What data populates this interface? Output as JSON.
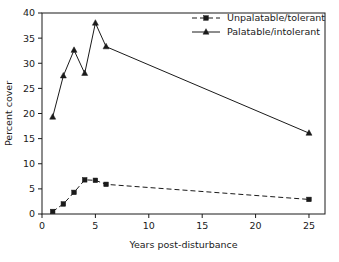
{
  "chart_data": {
    "type": "line",
    "title": "",
    "xlabel": "Years post-disturbance",
    "ylabel": "Percent cover",
    "xlim": [
      0,
      26.5
    ],
    "ylim": [
      0,
      40
    ],
    "xticks": [
      "0",
      "5",
      "10",
      "15",
      "20",
      "25"
    ],
    "xtick_values": [
      0,
      5,
      10,
      15,
      20,
      25
    ],
    "yticks": [
      "0",
      "5",
      "10",
      "15",
      "20",
      "25",
      "30",
      "35",
      "40"
    ],
    "ytick_values": [
      0,
      5,
      10,
      15,
      20,
      25,
      30,
      35,
      40
    ],
    "grid": false,
    "legend_position": "top-right-inside",
    "x": [
      1,
      2,
      3,
      4,
      5,
      6,
      25
    ],
    "series": [
      {
        "name": "Unpalatable/tolerant",
        "marker": "square",
        "linestyle": "dashed",
        "color": "#1a1a1a",
        "values": [
          0.5,
          2.0,
          4.3,
          6.8,
          6.7,
          5.9,
          2.9
        ]
      },
      {
        "name": "Palatable/intolerant",
        "marker": "triangle",
        "linestyle": "solid",
        "color": "#1a1a1a",
        "values": [
          19.3,
          27.5,
          32.6,
          28.0,
          38.0,
          33.3,
          16.1
        ]
      }
    ]
  },
  "legend": {
    "items": [
      {
        "label": "Unpalatable/tolerant"
      },
      {
        "label": "Palatable/intolerant"
      }
    ]
  },
  "axes": {
    "x_title": "Years post-disturbance",
    "y_title": "Percent cover"
  }
}
